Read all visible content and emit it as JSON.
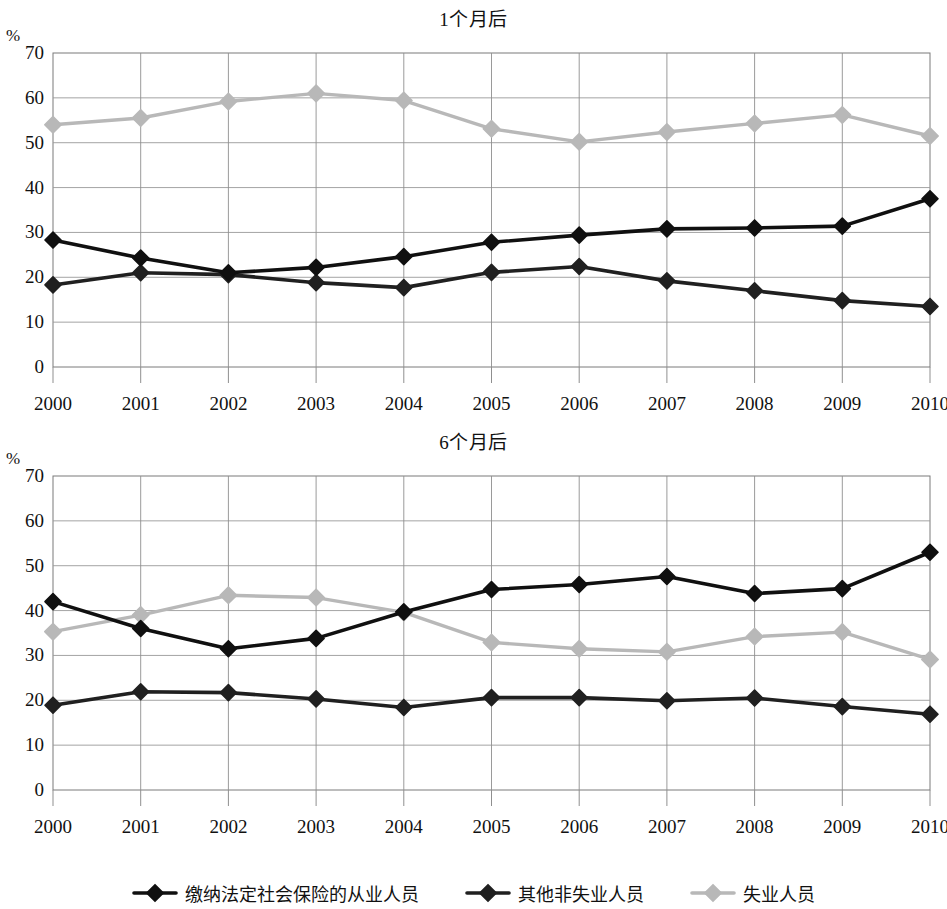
{
  "figure": {
    "axis_unit_label": "%",
    "legend_items": [
      {
        "label": "缴纳法定社会保险的从业人员",
        "color": "#101010",
        "marker": "diamond-filled"
      },
      {
        "label": "其他非失业人员",
        "color": "#202020",
        "marker": "diamond-filled"
      },
      {
        "label": "失业人员",
        "color": "#b8b8b8",
        "marker": "diamond-filled"
      }
    ]
  },
  "chart_data": [
    {
      "type": "line",
      "title": "1个月后",
      "xlabel": "",
      "ylabel": "%",
      "ylim": [
        0,
        70
      ],
      "yticks": [
        0,
        10,
        20,
        30,
        40,
        50,
        60,
        70
      ],
      "grid": true,
      "legend_position": "bottom",
      "categories": [
        "2000",
        "2001",
        "2002",
        "2003",
        "2004",
        "2005",
        "2006",
        "2007",
        "2008",
        "2009",
        "2010"
      ],
      "series": [
        {
          "name": "缴纳法定社会保险的从业人员",
          "color": "#101010",
          "values": [
            28.3,
            24.3,
            21.0,
            22.2,
            24.6,
            27.8,
            29.4,
            30.8,
            31.0,
            31.4,
            37.5
          ]
        },
        {
          "name": "其他非失业人员",
          "color": "#202020",
          "values": [
            18.3,
            21.0,
            20.6,
            18.8,
            17.7,
            21.1,
            22.4,
            19.2,
            17.0,
            14.8,
            13.5
          ]
        },
        {
          "name": "失业人员",
          "color": "#b8b8b8",
          "values": [
            54.0,
            55.5,
            59.2,
            61.0,
            59.4,
            53.1,
            50.2,
            52.4,
            54.3,
            56.2,
            51.5
          ]
        }
      ]
    },
    {
      "type": "line",
      "title": "6个月后",
      "xlabel": "",
      "ylabel": "%",
      "ylim": [
        0,
        70
      ],
      "yticks": [
        0,
        10,
        20,
        30,
        40,
        50,
        60,
        70
      ],
      "grid": true,
      "legend_position": "bottom",
      "categories": [
        "2000",
        "2001",
        "2002",
        "2003",
        "2004",
        "2005",
        "2006",
        "2007",
        "2008",
        "2009",
        "2010"
      ],
      "series": [
        {
          "name": "缴纳法定社会保险的从业人员",
          "color": "#101010",
          "values": [
            42.0,
            36.0,
            31.5,
            33.8,
            39.7,
            44.7,
            45.8,
            47.6,
            43.8,
            44.9,
            53.0
          ]
        },
        {
          "name": "其他非失业人员",
          "color": "#202020",
          "values": [
            18.9,
            21.9,
            21.7,
            20.3,
            18.4,
            20.6,
            20.6,
            19.9,
            20.5,
            18.6,
            16.9
          ]
        },
        {
          "name": "失业人员",
          "color": "#b8b8b8",
          "values": [
            35.3,
            39.0,
            43.4,
            42.9,
            39.6,
            32.9,
            31.5,
            30.8,
            34.2,
            35.2,
            29.1
          ]
        }
      ]
    }
  ]
}
